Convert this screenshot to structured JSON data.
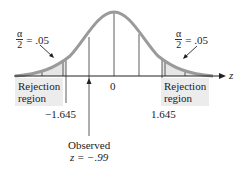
{
  "diagram": {
    "axis_label": "z",
    "left_tail": {
      "alpha_numerator": "α",
      "alpha_denominator": "2",
      "alpha_value": "= .05"
    },
    "right_tail": {
      "alpha_numerator": "α",
      "alpha_denominator": "2",
      "alpha_value": "= .05"
    },
    "rejection_label_left": {
      "line1": "Rejection",
      "line2": "region"
    },
    "rejection_label_right": {
      "line1": "Rejection",
      "line2": "region"
    },
    "center_tick": "0",
    "critical_left": "−1.645",
    "critical_right": "1.645",
    "observed": {
      "line1": "Observed",
      "line2": "z = −.99"
    },
    "colors": {
      "curve": "#9a9a9a",
      "shade": "#e6e6e6",
      "lines": "#333333"
    }
  }
}
